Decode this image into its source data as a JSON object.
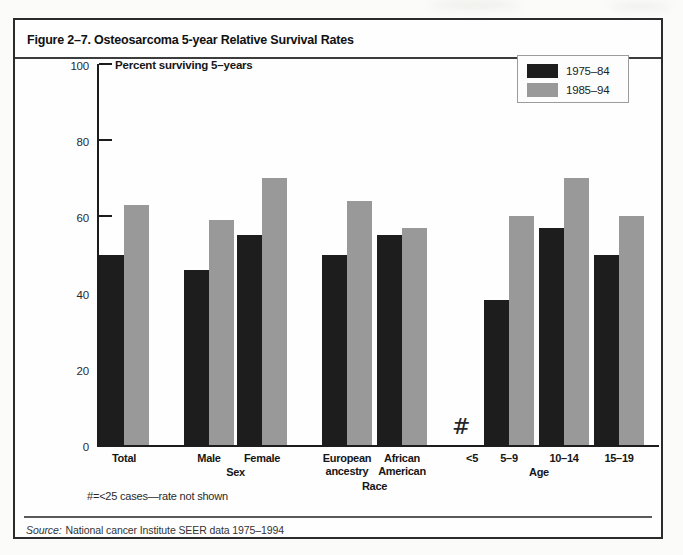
{
  "figure": {
    "title": "Figure 2–7. Osteosarcoma 5-year Relative Survival Rates",
    "footnote": "#=<25 cases—rate not shown",
    "source": {
      "label": "Source:",
      "text": "National cancer Institute SEER data 1975–1994"
    }
  },
  "chart_data": {
    "type": "bar",
    "title": "Figure 2–7. Osteosarcoma 5-year Relative Survival Rates",
    "ylabel": "Percent surviving 5–years",
    "xlabel": "",
    "ylim": [
      0,
      100
    ],
    "yticks": [
      0,
      20,
      40,
      60,
      80,
      100
    ],
    "grid": false,
    "legend_position": "top-right",
    "legend": [
      {
        "name": "1975–84",
        "color": "#1d1d1d"
      },
      {
        "name": "1985–94",
        "color": "#999999"
      }
    ],
    "categories": [
      "Total",
      "Male",
      "Female",
      "European ancestry",
      "African American",
      "<5",
      "5–9",
      "10–14",
      "15–19"
    ],
    "group_sections": [
      {
        "label": "",
        "categories": [
          "Total"
        ]
      },
      {
        "label": "Sex",
        "categories": [
          "Male",
          "Female"
        ]
      },
      {
        "label": "Race",
        "categories": [
          "European ancestry",
          "African American"
        ]
      },
      {
        "label": "Age",
        "categories": [
          "<5",
          "5–9",
          "10–14",
          "15–19"
        ]
      }
    ],
    "series": [
      {
        "name": "1975–84",
        "values": [
          50,
          46,
          55,
          50,
          55,
          null,
          38,
          57,
          50
        ]
      },
      {
        "name": "1985–94",
        "values": [
          63,
          59,
          70,
          64,
          57,
          null,
          60,
          70,
          60
        ]
      }
    ],
    "missing_marker": {
      "category": "<5",
      "symbol": "#",
      "meaning": "<25 cases—rate not shown"
    }
  }
}
